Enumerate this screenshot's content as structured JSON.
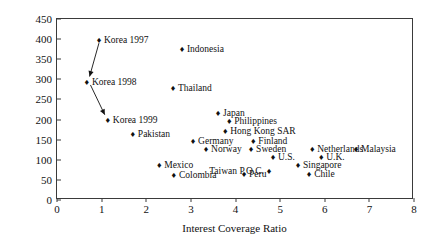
{
  "chart_data": {
    "type": "scatter",
    "title": "",
    "xlabel": "Interest Coverage Ratio",
    "ylabel": "Debt-to-equity Ratio (percent)",
    "xlim": [
      0,
      8
    ],
    "ylim": [
      0,
      450
    ],
    "xticks": [
      "0",
      "1",
      "2",
      "3",
      "4",
      "5",
      "6",
      "7",
      "8"
    ],
    "yticks": [
      "0",
      "50",
      "100",
      "150",
      "200",
      "250",
      "300",
      "350",
      "400",
      "450"
    ],
    "grid": false,
    "legend": "none",
    "marker_glyph": "♦",
    "points": [
      {
        "label": "Korea 1997",
        "x": 0.94,
        "y": 398,
        "pos": "right"
      },
      {
        "label": "Korea 1998",
        "x": 0.67,
        "y": 294,
        "pos": "right"
      },
      {
        "label": "Korea 1999",
        "x": 1.14,
        "y": 199,
        "pos": "right"
      },
      {
        "label": "Indonesia",
        "x": 2.8,
        "y": 376,
        "pos": "right"
      },
      {
        "label": "Thailand",
        "x": 2.6,
        "y": 279,
        "pos": "right"
      },
      {
        "label": "Pakistan",
        "x": 1.7,
        "y": 164,
        "pos": "right"
      },
      {
        "label": "Japan",
        "x": 3.61,
        "y": 217,
        "pos": "right"
      },
      {
        "label": "Philippines",
        "x": 3.86,
        "y": 197,
        "pos": "right"
      },
      {
        "label": "Hong Kong SAR",
        "x": 3.77,
        "y": 172,
        "pos": "right"
      },
      {
        "label": "Germany",
        "x": 3.05,
        "y": 147,
        "pos": "right"
      },
      {
        "label": "Norway",
        "x": 3.34,
        "y": 127,
        "pos": "right"
      },
      {
        "label": "Finland",
        "x": 4.4,
        "y": 147,
        "pos": "right"
      },
      {
        "label": "Sweden",
        "x": 4.35,
        "y": 127,
        "pos": "right"
      },
      {
        "label": "U.S.",
        "x": 4.84,
        "y": 107,
        "pos": "right"
      },
      {
        "label": "Mexico",
        "x": 2.29,
        "y": 87,
        "pos": "right"
      },
      {
        "label": "Colombia",
        "x": 2.62,
        "y": 62,
        "pos": "right"
      },
      {
        "label": "Taiwan P.O.C.",
        "x": 4.75,
        "y": 72,
        "pos": "left"
      },
      {
        "label": "Peru",
        "x": 4.19,
        "y": 65,
        "pos": "right"
      },
      {
        "label": "Netherlands",
        "x": 5.72,
        "y": 127,
        "pos": "right"
      },
      {
        "label": "Malaysia",
        "x": 6.7,
        "y": 127,
        "pos": "right"
      },
      {
        "label": "U.K.",
        "x": 5.92,
        "y": 107,
        "pos": "right"
      },
      {
        "label": "Singapore",
        "x": 5.4,
        "y": 87,
        "pos": "right"
      },
      {
        "label": "Chile",
        "x": 5.65,
        "y": 65,
        "pos": "right"
      }
    ],
    "arrows": [
      {
        "name": "korea-1997-to-1998",
        "from": [
          0.94,
          390
        ],
        "to": [
          0.73,
          307
        ]
      },
      {
        "name": "korea-1998-to-1999",
        "from": [
          0.75,
          286
        ],
        "to": [
          1.07,
          212
        ]
      }
    ]
  }
}
